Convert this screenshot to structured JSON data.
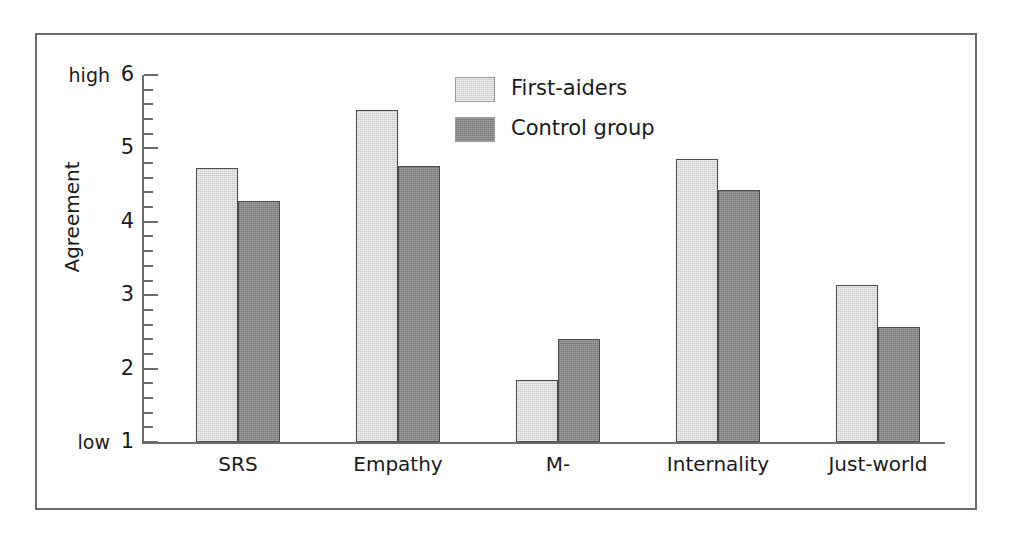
{
  "chart_data": {
    "type": "bar",
    "title": "",
    "xlabel": "",
    "ylabel": "Agreement",
    "categories": [
      "SRS",
      "Empathy",
      "M-",
      "Internality",
      "Just-world"
    ],
    "series": [
      {
        "name": "First-aiders",
        "values": [
          4.73,
          5.52,
          1.85,
          4.85,
          3.14
        ],
        "color": "#c9c9c9"
      },
      {
        "name": "Control group",
        "values": [
          4.29,
          4.76,
          2.4,
          4.43,
          2.57
        ],
        "color": "#858585"
      }
    ],
    "ylim": [
      1,
      6
    ],
    "ytick_labels": [
      "1",
      "2",
      "3",
      "4",
      "5",
      "6"
    ],
    "ytick_values": [
      1,
      2,
      3,
      4,
      5,
      6
    ],
    "y_minor_step": 0.2,
    "y_axis_end_labels": {
      "high": "high",
      "low": "low"
    },
    "grid": false,
    "legend_position": "top-center",
    "legend": [
      "First-aiders",
      "Control group"
    ]
  },
  "axis": {
    "ylabel": "Agreement",
    "high_label": "high",
    "low_label": "low"
  },
  "legend": {
    "items": [
      {
        "label": "First-aiders"
      },
      {
        "label": "Control group"
      }
    ]
  }
}
